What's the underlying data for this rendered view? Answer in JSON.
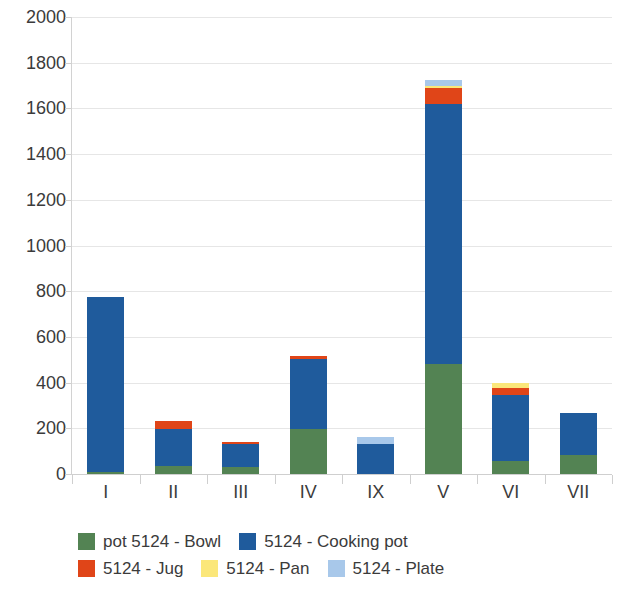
{
  "chart_data": {
    "type": "bar",
    "stacked": true,
    "title": "",
    "subtitle": "",
    "xlabel": "",
    "ylabel": "",
    "ylim": [
      0,
      2000
    ],
    "ytick_step": 200,
    "yticks": [
      2000,
      1800,
      1600,
      1400,
      1200,
      1000,
      800,
      600,
      400,
      200,
      0
    ],
    "ytick_labels": [
      "2000",
      "1800",
      "1600",
      "1400",
      "1200",
      "1000",
      "800",
      "600",
      "400",
      "200",
      "0"
    ],
    "grid": true,
    "legend_position": "bottom-left",
    "categories": [
      "I",
      "II",
      "III",
      "IV",
      "IX",
      "V",
      "VI",
      "VII"
    ],
    "series": [
      {
        "name": "pot 5124 - Bowl",
        "color": "#538353",
        "values": [
          10,
          35,
          30,
          195,
          0,
          480,
          55,
          85
        ]
      },
      {
        "name": "5124 - Cooking pot",
        "color": "#1f5b9c",
        "values": [
          765,
          160,
          100,
          310,
          130,
          1140,
          290,
          180
        ]
      },
      {
        "name": "5124 - Jug",
        "color": "#e04518",
        "values": [
          0,
          35,
          10,
          10,
          0,
          70,
          30,
          0
        ]
      },
      {
        "name": "5124 - Pan",
        "color": "#fbe77a",
        "values": [
          0,
          0,
          0,
          0,
          0,
          10,
          25,
          0
        ]
      },
      {
        "name": "5124 - Plate",
        "color": "#a8c8ea",
        "values": [
          0,
          0,
          0,
          0,
          30,
          25,
          0,
          0
        ]
      }
    ],
    "totals": [
      775,
      230,
      140,
      515,
      160,
      1725,
      400,
      265
    ]
  },
  "legend": {
    "rows": [
      [
        {
          "label": "pot 5124 - Bowl",
          "color": "#538353"
        },
        {
          "label": "5124 - Cooking pot",
          "color": "#1f5b9c"
        }
      ],
      [
        {
          "label": "5124 - Jug",
          "color": "#e04518"
        },
        {
          "label": "5124 - Pan",
          "color": "#fbe77a"
        },
        {
          "label": "5124 - Plate",
          "color": "#a8c8ea"
        }
      ]
    ]
  },
  "axis_colors": {
    "grid": "#e6e6e6",
    "axis": "#cfcfcf",
    "text": "#3b3b3b"
  }
}
